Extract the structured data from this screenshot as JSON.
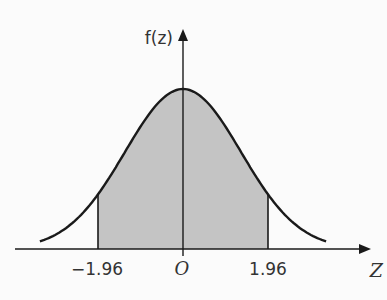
{
  "chart_data": {
    "type": "area",
    "title": "",
    "xlabel": "Z",
    "ylabel": "f(z)",
    "xlim": [
      -3.3,
      3.3
    ],
    "shaded_interval": [
      -1.96,
      1.96
    ],
    "tick_labels": [
      "-1.96",
      "O",
      "1.96"
    ],
    "tick_values": [
      -1.96,
      0,
      1.96
    ],
    "grid": false,
    "legend": "none",
    "colors": {
      "shade": "#c4c4c4",
      "line": "#1a1a1a",
      "background": "#fbfbfb"
    }
  }
}
